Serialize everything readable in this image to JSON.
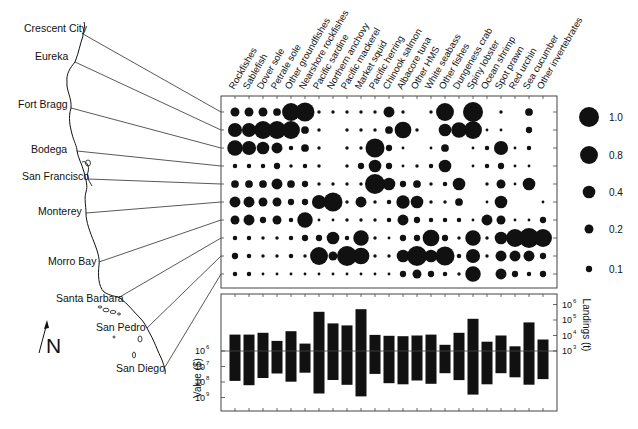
{
  "figure": {
    "north_label": "N",
    "colors": {
      "ink": "#111111",
      "axis": "#444444",
      "background": "#ffffff"
    }
  },
  "map": {
    "ports": [
      {
        "name": "Crescent City",
        "label_x": 24,
        "label_y": 32,
        "coast_x": 83,
        "coast_y": 34
      },
      {
        "name": "Eureka",
        "label_x": 35,
        "label_y": 60,
        "coast_x": 75,
        "coast_y": 62
      },
      {
        "name": "Fort Bragg",
        "label_x": 18,
        "label_y": 108,
        "coast_x": 71,
        "coast_y": 108
      },
      {
        "name": "Bodega",
        "label_x": 31,
        "label_y": 153,
        "coast_x": 77,
        "coast_y": 151
      },
      {
        "name": "San Francisco",
        "label_x": 22,
        "label_y": 180,
        "coast_x": 88,
        "coast_y": 179
      },
      {
        "name": "Monterey",
        "label_x": 38,
        "label_y": 215,
        "coast_x": 86,
        "coast_y": 213
      },
      {
        "name": "Morro Bay",
        "label_x": 48,
        "label_y": 265,
        "coast_x": 99,
        "coast_y": 262
      },
      {
        "name": "Santa Barbara",
        "label_x": 56,
        "label_y": 302,
        "coast_x": 118,
        "coast_y": 298
      },
      {
        "name": "San Pedro",
        "label_x": 96,
        "label_y": 331,
        "coast_x": 147,
        "coast_y": 328
      },
      {
        "name": "San Diego",
        "label_x": 116,
        "label_y": 372,
        "coast_x": 165,
        "coast_y": 367
      }
    ]
  },
  "chart_data": [
    {
      "type": "scatter",
      "subtype": "bubble-matrix",
      "title": "",
      "x_categories": [
        "Rockfishes",
        "Sablefish",
        "Dover sole",
        "Petrale sole",
        "Other groundfishes",
        "Nearshore rockfishes",
        "Pacific sardine",
        "Northern anchovy",
        "Pacific mackerel",
        "Market squid",
        "Pacific herring",
        "Chinook salmon",
        "Albacore tuna",
        "Other HMS",
        "White seabass",
        "Other fishes",
        "Dungeness crab",
        "Spiny lobster",
        "Ocean shrimp",
        "Spot prawn",
        "Red urchin",
        "Sea cucumber",
        "Other invertebrates"
      ],
      "y_categories": [
        "Crescent City",
        "Eureka",
        "Fort Bragg",
        "Bodega",
        "San Francisco",
        "Monterey",
        "Morro Bay",
        "Santa Barbara",
        "San Pedro",
        "San Diego"
      ],
      "legend": {
        "title": "",
        "position": "right",
        "entries": [
          {
            "label": "1.0",
            "value": 1.0
          },
          {
            "label": "0.8",
            "value": 0.8
          },
          {
            "label": "0.4",
            "value": 0.4
          },
          {
            "label": "0.2",
            "value": 0.2
          },
          {
            "label": "0.1",
            "value": 0.1
          }
        ]
      },
      "values": [
        [
          0.2,
          0.2,
          0.2,
          0.15,
          0.8,
          0.9,
          0.03,
          0.03,
          0.03,
          0.03,
          0.03,
          0.3,
          0.03,
          0,
          0.03,
          0.8,
          0,
          1.0,
          0,
          0.03,
          0,
          0.15,
          0
        ],
        [
          0.5,
          0.5,
          0.8,
          0.8,
          0.8,
          0.15,
          0.03,
          0,
          0.03,
          0.03,
          0.03,
          0.15,
          0.7,
          0.03,
          0,
          0.4,
          0.6,
          0.8,
          0.02,
          0.02,
          0,
          0.1,
          0
        ],
        [
          0.6,
          0.5,
          0.4,
          0.3,
          0.05,
          0.15,
          0.03,
          0,
          0.03,
          0.03,
          0.9,
          0.1,
          0.02,
          0,
          0.02,
          0.15,
          0,
          0.02,
          0.05,
          0.5,
          0.02,
          0.05,
          0
        ],
        [
          0.05,
          0.05,
          0.05,
          0.1,
          0.03,
          0.05,
          0.03,
          0,
          0.03,
          0.1,
          0.4,
          0.1,
          0.02,
          0.03,
          0.05,
          0.4,
          0,
          0.02,
          0.05,
          0.1,
          0.02,
          0.02,
          0
        ],
        [
          0.15,
          0.15,
          0.15,
          0.3,
          0.15,
          0.1,
          0.03,
          0.03,
          0.03,
          0.03,
          1.0,
          0.4,
          0.1,
          0.15,
          0.03,
          0.05,
          0.4,
          0,
          0.03,
          0.2,
          0.02,
          0.4,
          0
        ],
        [
          0.3,
          0.3,
          0.2,
          0.2,
          0.1,
          0.1,
          0.5,
          0.9,
          0.03,
          0.3,
          0.03,
          0.05,
          0.45,
          0.4,
          0.03,
          0.03,
          0.15,
          0,
          0.02,
          0.4,
          0,
          0,
          0.02
        ],
        [
          0.2,
          0.3,
          0.1,
          0.2,
          0.05,
          0.6,
          0.02,
          0.02,
          0.03,
          0.03,
          0.03,
          0.05,
          0.3,
          0.1,
          0.05,
          0.05,
          0.05,
          0.02,
          0.3,
          0.2,
          0.02,
          0.02,
          0.1
        ],
        [
          0.05,
          0.05,
          0.03,
          0.03,
          0.05,
          0.1,
          0.1,
          0.4,
          0.05,
          0.6,
          0.03,
          0.02,
          0.1,
          0.1,
          0.7,
          0.1,
          0.03,
          0.6,
          0.03,
          0.4,
          0.8,
          1.0,
          0.8
        ],
        [
          0.1,
          0.05,
          0.03,
          0.03,
          0.05,
          0.03,
          0.8,
          0.2,
          1.0,
          0.7,
          0.03,
          0.03,
          0.4,
          1.0,
          0.4,
          0.9,
          0.05,
          0.5,
          0.03,
          0.3,
          0.3,
          0.3,
          0.1
        ],
        [
          0.05,
          0.05,
          0.02,
          0.02,
          0.02,
          0.02,
          0.02,
          0.02,
          0.02,
          0.02,
          0.02,
          0.02,
          0.1,
          0.2,
          0.1,
          0.05,
          0.03,
          0.6,
          0,
          0.3,
          0.1,
          0.05,
          0.1
        ]
      ]
    },
    {
      "type": "bar",
      "subtype": "floating-bidirectional",
      "title": "",
      "categories": [
        "Rockfishes",
        "Sablefish",
        "Dover sole",
        "Petrale sole",
        "Other groundfishes",
        "Nearshore rockfishes",
        "Pacific sardine",
        "Northern anchovy",
        "Pacific mackerel",
        "Market squid",
        "Pacific herring",
        "Chinook salmon",
        "Albacore tuna",
        "Other HMS",
        "White seabass",
        "Other fishes",
        "Dungeness crab",
        "Spiny lobster",
        "Ocean shrimp",
        "Spot prawn",
        "Red urchin",
        "Sea cucumber",
        "Other invertebrates"
      ],
      "series": [
        {
          "name": "Landings (t)",
          "direction": "up",
          "axis": "right",
          "scale": "log10",
          "values": [
            11500,
            11500,
            15000,
            4500,
            19000,
            3000,
            340000,
            60000,
            45000,
            500000,
            11000,
            9500,
            9000,
            10000,
            11500,
            2500,
            15000,
            120000,
            4000,
            10000,
            2000,
            70000,
            5500
          ]
        },
        {
          "name": "Value ($)",
          "direction": "down",
          "axis": "left",
          "scale": "log10",
          "values": [
            85000000,
            160000000,
            55000000,
            28000000,
            95000000,
            25000000,
            550000000,
            75000000,
            150000000,
            850000000,
            30000000,
            120000000,
            140000000,
            80000000,
            130000000,
            27000000,
            75000000,
            650000000,
            140000000,
            27000000,
            50000000,
            150000000,
            65000000
          ]
        }
      ],
      "ylabel_left": "Value ($)",
      "ylabel_right": "Landings (t)",
      "left_ticks": [
        "10^6",
        "10^7",
        "10^8",
        "10^9"
      ],
      "right_ticks": [
        "10^3",
        "10^4",
        "10^5",
        "10^6"
      ],
      "grid": false
    }
  ]
}
